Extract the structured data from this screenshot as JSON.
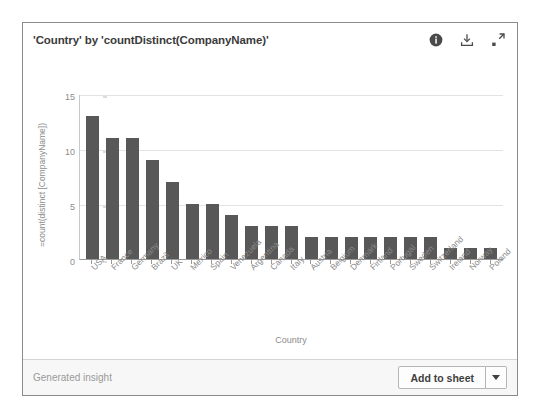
{
  "card": {
    "title": "'Country' by 'countDistinct(CompanyName)'",
    "icons": {
      "info": "info-icon",
      "download": "download-icon",
      "expand": "expand-icon"
    }
  },
  "footer": {
    "note": "Generated insight",
    "add_label": "Add to sheet",
    "caret": "chevron-down-icon"
  },
  "chart_data": {
    "type": "bar",
    "title": "'Country' by 'countDistinct(CompanyName)'",
    "xlabel": "Country",
    "ylabel": "=count(distinct [CompanyName])",
    "ylim": [
      0,
      15
    ],
    "yticks": [
      0,
      5,
      10,
      15
    ],
    "grid": true,
    "legend": false,
    "bar_color": "#585858",
    "categories": [
      "USA",
      "France",
      "Germany",
      "Brazil",
      "UK",
      "Mexico",
      "Spain",
      "Venezuela",
      "Argentina",
      "Canada",
      "Italy",
      "Austria",
      "Belgium",
      "Denmark",
      "Finland",
      "Portugal",
      "Sweden",
      "Switzerland",
      "Ireland",
      "Norway",
      "Poland"
    ],
    "values": [
      13,
      11,
      11,
      9,
      7,
      5,
      5,
      4,
      3,
      3,
      3,
      2,
      2,
      2,
      2,
      2,
      2,
      2,
      1,
      1,
      1
    ]
  }
}
